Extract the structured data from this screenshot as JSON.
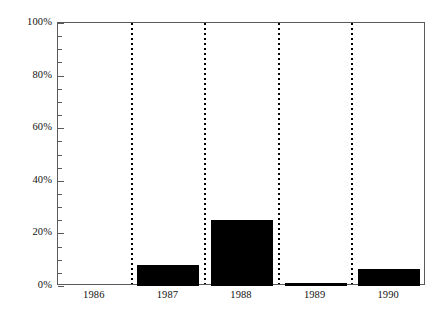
{
  "chart_data": {
    "type": "bar",
    "title": "",
    "subtitle": "",
    "xlabel": "",
    "ylabel": "",
    "categories": [
      "1986",
      "1987",
      "1988",
      "1989",
      "1990"
    ],
    "values": [
      0,
      8,
      25,
      1,
      6.5
    ],
    "value_unit": "%",
    "ylim": [
      0,
      100
    ],
    "y_tick_labels": [
      "0%",
      "20%",
      "40%",
      "60%",
      "80%",
      "100%"
    ],
    "y_tick_values": [
      0,
      20,
      40,
      60,
      80,
      100
    ],
    "y_minor_tick_step": 5,
    "grid": "vertical-dotted-category-separators",
    "legend": "none",
    "series": [
      {
        "name": "",
        "values": [
          0,
          8,
          25,
          1,
          6.5
        ]
      }
    ],
    "colors": {
      "bar": "#000000",
      "axis": "#5a5a5a",
      "gridline": "#000000",
      "background": "#ffffff",
      "text": "#111111"
    }
  }
}
